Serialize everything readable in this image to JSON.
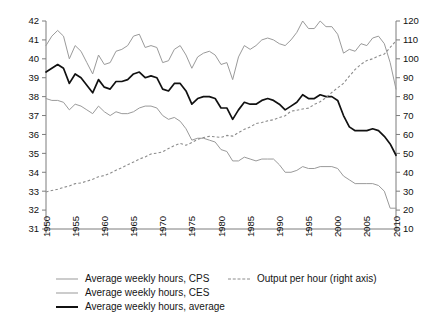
{
  "chart_data": {
    "type": "line",
    "title": "",
    "subtitle": "",
    "xlabel": "",
    "ylabel": "",
    "y2label": "",
    "grid": false,
    "legend_position": "bottom",
    "xlim": [
      1950,
      2010
    ],
    "ylim": [
      31,
      42
    ],
    "y2lim": [
      10,
      120
    ],
    "xticks": [
      "1950",
      "1955",
      "1960",
      "1965",
      "1970",
      "1975",
      "1980",
      "1985",
      "1990",
      "1995",
      "2000",
      "2005",
      "2010"
    ],
    "yticks_left": [
      "31",
      "32",
      "33",
      "34",
      "35",
      "36",
      "37",
      "38",
      "39",
      "40",
      "41",
      "42"
    ],
    "yticks_right": [
      "10",
      "20",
      "30",
      "40",
      "50",
      "60",
      "70",
      "80",
      "90",
      "100",
      "110",
      "120"
    ],
    "x": [
      1950,
      1951,
      1952,
      1953,
      1954,
      1955,
      1956,
      1957,
      1958,
      1959,
      1960,
      1961,
      1962,
      1963,
      1964,
      1965,
      1966,
      1967,
      1968,
      1969,
      1970,
      1971,
      1972,
      1973,
      1974,
      1975,
      1976,
      1977,
      1978,
      1979,
      1980,
      1981,
      1982,
      1983,
      1984,
      1985,
      1986,
      1987,
      1988,
      1989,
      1990,
      1991,
      1992,
      1993,
      1994,
      1995,
      1996,
      1997,
      1998,
      1999,
      2000,
      2001,
      2002,
      2003,
      2004,
      2005,
      2006,
      2007,
      2008,
      2009,
      2010
    ],
    "series": [
      {
        "name": "Average weekly hours, CPS",
        "axis": "left",
        "style": "solid",
        "color": "#9a9a9a",
        "values": [
          37.9,
          37.8,
          37.8,
          37.7,
          37.3,
          37.6,
          37.5,
          37.3,
          37.1,
          37.5,
          37.2,
          37.0,
          37.2,
          37.1,
          37.1,
          37.2,
          37.4,
          37.5,
          37.5,
          37.4,
          37.0,
          36.8,
          36.9,
          36.7,
          36.3,
          35.7,
          35.8,
          35.8,
          35.7,
          35.6,
          35.2,
          35.1,
          34.6,
          34.6,
          34.8,
          34.7,
          34.6,
          34.7,
          34.7,
          34.7,
          34.4,
          34.0,
          34.0,
          34.1,
          34.3,
          34.2,
          34.2,
          34.3,
          34.3,
          34.3,
          34.2,
          33.8,
          33.6,
          33.4,
          33.4,
          33.4,
          33.4,
          33.3,
          33.0,
          32.1,
          32.1
        ]
      },
      {
        "name": "Average weekly hours, CES",
        "axis": "left",
        "style": "solid",
        "color": "#9a9a9a",
        "values": [
          40.7,
          41.2,
          41.5,
          41.2,
          40.0,
          40.7,
          40.4,
          39.8,
          39.2,
          40.2,
          39.7,
          39.8,
          40.4,
          40.5,
          40.7,
          41.2,
          41.3,
          40.6,
          40.7,
          40.6,
          39.8,
          39.9,
          40.5,
          40.7,
          40.2,
          39.5,
          40.1,
          40.3,
          40.4,
          40.2,
          39.7,
          39.8,
          38.9,
          40.1,
          40.7,
          40.5,
          40.7,
          41.0,
          41.1,
          41.0,
          40.8,
          40.7,
          41.0,
          41.4,
          42.0,
          41.6,
          41.6,
          42.0,
          41.7,
          41.7,
          41.3,
          40.3,
          40.5,
          40.4,
          40.8,
          40.7,
          41.1,
          41.2,
          40.8,
          39.8,
          38.4
        ]
      },
      {
        "name": "Average weekly hours, average",
        "axis": "left",
        "style": "solid-bold",
        "color": "#111111",
        "values": [
          39.3,
          39.5,
          39.7,
          39.5,
          38.7,
          39.2,
          39.0,
          38.6,
          38.2,
          38.9,
          38.5,
          38.4,
          38.8,
          38.8,
          38.9,
          39.2,
          39.3,
          39.0,
          39.1,
          39.0,
          38.4,
          38.3,
          38.7,
          38.7,
          38.3,
          37.6,
          37.9,
          38.0,
          38.0,
          37.9,
          37.4,
          37.4,
          36.8,
          37.3,
          37.7,
          37.6,
          37.6,
          37.8,
          37.9,
          37.8,
          37.6,
          37.3,
          37.5,
          37.7,
          38.1,
          37.9,
          37.9,
          38.1,
          38.0,
          38.0,
          37.8,
          37.0,
          36.4,
          36.2,
          36.2,
          36.2,
          36.3,
          36.2,
          35.9,
          35.5,
          34.9
        ]
      },
      {
        "name": "Output per hour (right axis)",
        "axis": "right",
        "style": "dashed",
        "color": "#8c8c8c",
        "values": [
          29.6,
          30.4,
          31.0,
          32.0,
          32.7,
          34.0,
          34.3,
          35.3,
          36.3,
          37.6,
          38.3,
          39.5,
          41.1,
          42.4,
          44.0,
          45.4,
          47.0,
          48.1,
          49.7,
          50.1,
          50.8,
          52.6,
          54.1,
          55.3,
          54.3,
          55.7,
          57.4,
          58.4,
          59.0,
          58.8,
          58.4,
          59.5,
          59.1,
          61.0,
          62.7,
          63.9,
          65.8,
          66.3,
          67.2,
          67.8,
          68.9,
          69.9,
          72.3,
          72.8,
          73.5,
          73.9,
          75.9,
          77.3,
          79.5,
          82.2,
          84.7,
          87.0,
          90.8,
          94.4,
          97.1,
          99.1,
          100.0,
          101.5,
          102.5,
          106.0,
          109.5
        ]
      }
    ]
  },
  "legend": {
    "items": [
      {
        "label": "Average weekly hours, CPS",
        "swatch": "line-thin-gray"
      },
      {
        "label": "Average weekly hours, CES",
        "swatch": "line-thin-gray"
      },
      {
        "label": "Average weekly hours, average",
        "swatch": "line-bold-black"
      },
      {
        "label": "Output per hour (right axis)",
        "swatch": "line-dashed-gray"
      }
    ]
  },
  "colors": {
    "cps": "#9a9a9a",
    "ces": "#9a9a9a",
    "average": "#111111",
    "output": "#8c8c8c",
    "axis": "#7d7d7d",
    "background": "#ffffff"
  }
}
